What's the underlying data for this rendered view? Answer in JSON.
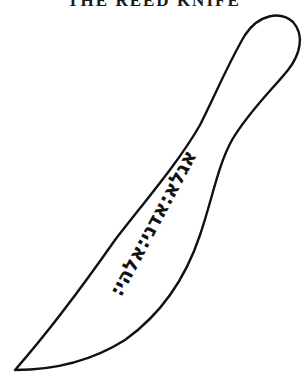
{
  "title": "THE REED KNIFE",
  "figure": {
    "subject": "knife",
    "inscription": "אגלא:אדני:אלהי:",
    "stroke_color": "#111111",
    "background_color": "#ffffff"
  }
}
